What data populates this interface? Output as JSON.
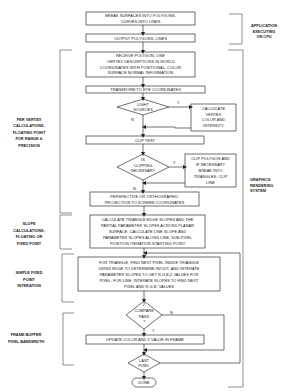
{
  "diagram": {
    "type": "flowchart",
    "section_labels": {
      "application": [
        "APPLICATION",
        "EXECUTING",
        "ON CPU"
      ],
      "graphics_system": [
        "GRAPHICS",
        "RENDERING",
        "SYSTEM"
      ],
      "per_vertex": [
        "PER VERTEX",
        "CALCULATIONS,",
        "FLOATING POINT",
        "FOR RANGE &",
        "PRECISION"
      ],
      "slope": [
        "SLOPE",
        "CALCULATIONS,",
        "FLOATING OR",
        "FIXED POINT"
      ],
      "simple_fixed": [
        "SIMPLE FIXED",
        "POINT",
        "INTERATION"
      ],
      "frame_buffer": [
        "FRAME BUFFER",
        "PIXEL BANDWIDTH"
      ]
    },
    "nodes": {
      "break_surfaces": [
        "BREAK SURFACES INTO POLYGONS,",
        "CURVES INTO LINES"
      ],
      "output_polygons": [
        "OUTPUT POLYGONS, LINES"
      ],
      "receive_polygon": [
        "RECEIVE POLYGON, LINE",
        "-VERTEX DESCRIPTIONS IN WORLD",
        "COORDINATES WITH POSITIONAL, COLOR",
        "SURFACE NORMAL INFORMATION"
      ],
      "transform_eye": [
        "TRANSFORM TO EYE COORDINATES"
      ],
      "light_sources": [
        "LIGHT",
        "SOURCES"
      ],
      "calc_vertex": [
        "CALCULATE",
        "VERTEX",
        "COLOR AND",
        "INTENSITY"
      ],
      "clip_test": [
        "CLIP TEST"
      ],
      "is_clipping": [
        "IS",
        "CLIPPING",
        "NECESSARY"
      ],
      "clip_polygon": [
        "CLIP POLYGON AND",
        "IF NECESSARY",
        "BREAK INTO",
        "TRIANGLES; CLIP",
        "LINE"
      ],
      "projection": [
        "PERSPECTIVE OR ORTHOGRAPHIC",
        "PROJECTION TO SCREEN COORDINATES"
      ],
      "calc_slopes": [
        "CALCULATE TRIANGLE EDGE SLOPES AND THE",
        "PARTIAL PARAMETER SLOPES ACROSS PLANAR",
        "SURFACE, CALCULATE LINE SLOPE AND",
        "PARAMETER SLOPES ALONG LINE, SUB-PIXEL",
        "POSITION ITERATION STARTING POINT"
      ],
      "find_next_pixel": [
        "FOR TRIANGLE, FIND NEXT PIXEL INSIDE TRIANGLE",
        "USING EDGE TO DETERMINE IN/OUT, AND INTERATE",
        "PARAMETER SLOPES TO GET R,G,B,Z VALUES FOR",
        "PIXEL; FOR LINE, INTERATE SLOPES TO FIND NEXT",
        "PIXEL AND R,G,B, VALUES"
      ],
      "z_compare": [
        "Z",
        "COMPARE",
        "PASS",
        "?"
      ],
      "update_color": [
        "UPDATE COLOR AND Z VALUE IN FRAME"
      ],
      "last_pixel": [
        "LAST",
        "PIXEL"
      ],
      "done": [
        "DONE"
      ]
    },
    "edge_labels": {
      "yes": "Y",
      "no": "N"
    },
    "colors": {
      "line": "#333333",
      "background": "#ffffff",
      "text": "#222222"
    }
  }
}
